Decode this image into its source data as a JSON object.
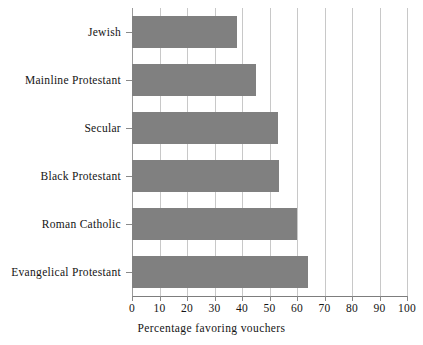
{
  "chart_data": {
    "type": "bar",
    "orientation": "horizontal",
    "title": "",
    "xlabel": "Percentage favoring vouchers",
    "ylabel": "",
    "categories": [
      "Jewish",
      "Mainline Protestant",
      "Secular",
      "Black Protestant",
      "Roman Catholic",
      "Evangelical Protestant"
    ],
    "values": [
      38,
      45,
      53,
      53.5,
      60,
      64
    ],
    "xlim": [
      0,
      100
    ],
    "xticks": [
      0,
      10,
      20,
      30,
      40,
      50,
      60,
      70,
      80,
      90,
      100
    ],
    "xtick_labels": [
      "0",
      "10",
      "20",
      "30",
      "40",
      "50",
      "60",
      "70",
      "80",
      "90",
      "100"
    ],
    "grid": "vertical",
    "legend": "none",
    "bar_color": "#808080",
    "gridline_color": "#c8c8c8",
    "axis_color": "#7d7d7d",
    "background": "#ffffff"
  }
}
